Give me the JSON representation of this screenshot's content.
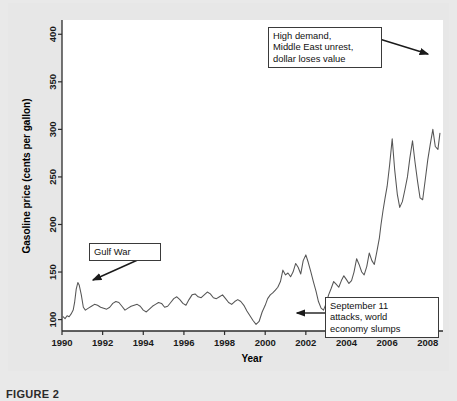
{
  "figure": {
    "caption": "FIGURE 2"
  },
  "chart_data": {
    "type": "line",
    "title": "",
    "xlabel": "Year",
    "ylabel": "Gasoline price (cents per gallon)",
    "xlim": [
      1990,
      2008.75
    ],
    "ylim": [
      88,
      415
    ],
    "grid": false,
    "legend": "none",
    "xticks": [
      1990,
      1992,
      1994,
      1996,
      1998,
      2000,
      2002,
      2004,
      2006,
      2008
    ],
    "yticks": [
      100,
      150,
      200,
      250,
      300,
      350,
      400
    ],
    "series": [
      {
        "name": "Gasoline price (cents per gallon)",
        "color": "#555555",
        "x": [
          1990.05,
          1990.15,
          1990.25,
          1990.35,
          1990.45,
          1990.55,
          1990.62,
          1990.7,
          1990.78,
          1990.85,
          1990.95,
          1991.05,
          1991.15,
          1991.3,
          1991.45,
          1991.6,
          1991.75,
          1991.9,
          1992.05,
          1992.2,
          1992.35,
          1992.5,
          1992.65,
          1992.8,
          1992.95,
          1993.1,
          1993.25,
          1993.4,
          1993.55,
          1993.7,
          1993.85,
          1994.0,
          1994.15,
          1994.3,
          1994.45,
          1994.6,
          1994.75,
          1994.9,
          1995.05,
          1995.2,
          1995.35,
          1995.5,
          1995.65,
          1995.8,
          1995.95,
          1996.1,
          1996.25,
          1996.4,
          1996.55,
          1996.7,
          1996.85,
          1997.0,
          1997.15,
          1997.3,
          1997.45,
          1997.6,
          1997.75,
          1997.9,
          1998.05,
          1998.2,
          1998.35,
          1998.5,
          1998.65,
          1998.8,
          1998.95,
          1999.1,
          1999.25,
          1999.4,
          1999.55,
          1999.7,
          1999.85,
          2000.0,
          2000.12,
          2000.25,
          2000.37,
          2000.5,
          2000.62,
          2000.75,
          2000.87,
          2001.0,
          2001.12,
          2001.25,
          2001.37,
          2001.5,
          2001.62,
          2001.75,
          2001.87,
          2002.0,
          2002.12,
          2002.25,
          2002.37,
          2002.5,
          2002.62,
          2002.75,
          2002.87,
          2003.0,
          2003.12,
          2003.25,
          2003.37,
          2003.5,
          2003.62,
          2003.75,
          2003.87,
          2004.0,
          2004.12,
          2004.25,
          2004.37,
          2004.5,
          2004.62,
          2004.75,
          2004.87,
          2005.0,
          2005.12,
          2005.25,
          2005.37,
          2005.5,
          2005.62,
          2005.7,
          2005.8,
          2005.9,
          2006.0,
          2006.12,
          2006.25,
          2006.37,
          2006.5,
          2006.62,
          2006.75,
          2006.87,
          2007.0,
          2007.12,
          2007.25,
          2007.37,
          2007.5,
          2007.62,
          2007.75,
          2007.87,
          2008.0,
          2008.12,
          2008.25,
          2008.37,
          2008.5,
          2008.6
        ],
        "y": [
          103,
          101,
          104,
          103,
          106,
          110,
          118,
          132,
          139,
          136,
          126,
          113,
          110,
          112,
          114,
          116,
          115,
          113,
          112,
          111,
          113,
          117,
          119,
          118,
          114,
          110,
          112,
          114,
          115,
          116,
          114,
          110,
          108,
          111,
          114,
          116,
          118,
          117,
          113,
          114,
          118,
          122,
          124,
          121,
          117,
          115,
          121,
          126,
          127,
          124,
          123,
          126,
          129,
          127,
          123,
          122,
          124,
          126,
          122,
          118,
          116,
          119,
          121,
          119,
          115,
          109,
          104,
          99,
          95,
          98,
          108,
          115,
          122,
          126,
          128,
          131,
          134,
          140,
          152,
          147,
          149,
          145,
          150,
          159,
          155,
          148,
          162,
          168,
          160,
          150,
          140,
          130,
          119,
          112,
          110,
          117,
          126,
          133,
          140,
          137,
          134,
          141,
          146,
          142,
          138,
          141,
          150,
          164,
          158,
          150,
          147,
          156,
          170,
          162,
          158,
          172,
          186,
          200,
          215,
          228,
          240,
          262,
          290,
          258,
          232,
          218,
          224,
          236,
          250,
          270,
          288,
          266,
          245,
          228,
          226,
          246,
          268,
          284,
          300,
          282,
          279,
          296
        ]
      }
    ],
    "annotations": [
      {
        "id": "gulf-war",
        "text": "Gulf War",
        "arrow_from": [
          151,
          254
        ],
        "arrow_to": [
          92,
          281
        ]
      },
      {
        "id": "high-demand",
        "text": "High demand,\nMiddle East unrest,\ndollar loses value",
        "arrow_from": [
          373,
          37
        ],
        "arrow_to": [
          429,
          54
        ]
      },
      {
        "id": "september-11",
        "text": "September 11\nattacks, world\neconomy slumps",
        "arrow_from": [
          325,
          313
        ],
        "arrow_to": [
          296,
          313
        ]
      }
    ]
  }
}
